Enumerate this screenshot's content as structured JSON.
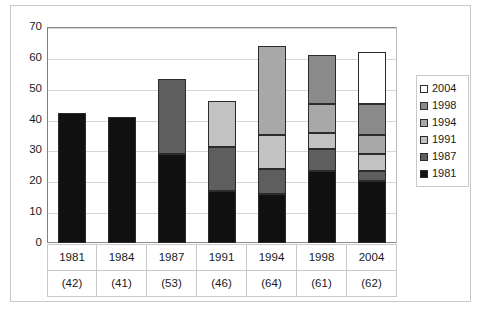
{
  "chart_data": {
    "type": "bar",
    "subtype": "stacked-bar",
    "title": "",
    "xlabel": "",
    "ylabel": "",
    "ylim": [
      0,
      70
    ],
    "yticks": [
      0,
      10,
      20,
      30,
      40,
      50,
      60,
      70
    ],
    "grid": true,
    "legend_position": "right",
    "legend_order": [
      "2004",
      "1998",
      "1994",
      "1991",
      "1987",
      "1981"
    ],
    "categories": [
      "1981",
      "1984",
      "1987",
      "1991",
      "1994",
      "1998",
      "2004"
    ],
    "category_totals": [
      "(42)",
      "(41)",
      "(53)",
      "(46)",
      "(64)",
      "(61)",
      "(62)"
    ],
    "totals": [
      42,
      41,
      53,
      46,
      64,
      61,
      62
    ],
    "series": [
      {
        "name": "1981",
        "color": "#111111",
        "values": [
          42,
          41,
          29,
          17,
          16,
          23.5,
          20
        ]
      },
      {
        "name": "1987",
        "color": "#5e5e5e",
        "values": [
          0,
          0,
          24,
          14,
          8,
          7,
          3.5
        ]
      },
      {
        "name": "1991",
        "color": "#c2c2c2",
        "values": [
          0,
          0,
          0,
          15,
          11,
          5,
          5.5
        ]
      },
      {
        "name": "1994",
        "color": "#a8a8a8",
        "values": [
          0,
          0,
          0,
          0,
          29,
          9.5,
          6
        ]
      },
      {
        "name": "1998",
        "color": "#8a8a8a",
        "values": [
          0,
          0,
          0,
          0,
          0,
          16,
          10
        ]
      },
      {
        "name": "2004",
        "color": "#ffffff",
        "values": [
          0,
          0,
          0,
          0,
          0,
          0,
          17
        ]
      }
    ]
  },
  "axis": {
    "y_tick_labels": [
      "70",
      "60",
      "50",
      "40",
      "30",
      "20",
      "10",
      "0"
    ]
  },
  "legend": {
    "items": [
      {
        "label": "2004",
        "color": "#ffffff"
      },
      {
        "label": "1998",
        "color": "#8a8a8a"
      },
      {
        "label": "1994",
        "color": "#a8a8a8"
      },
      {
        "label": "1991",
        "color": "#c2c2c2"
      },
      {
        "label": "1987",
        "color": "#5e5e5e"
      },
      {
        "label": "1981",
        "color": "#111111"
      }
    ]
  },
  "xtable": {
    "years": [
      "1981",
      "1984",
      "1987",
      "1991",
      "1994",
      "1998",
      "2004"
    ],
    "counts": [
      "(42)",
      "(41)",
      "(53)",
      "(46)",
      "(64)",
      "(61)",
      "(62)"
    ]
  }
}
